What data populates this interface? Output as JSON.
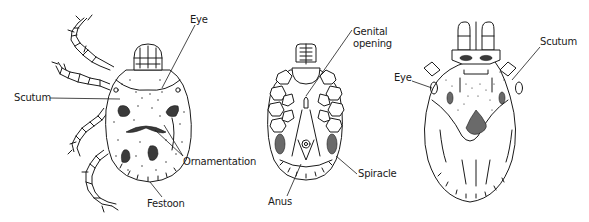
{
  "figures": [
    {
      "id": "dorsal-female",
      "labels": {
        "eye": "Eye",
        "scutum": "Scutum",
        "ornamentation": "Ornamentation",
        "festoon": "Festoon"
      }
    },
    {
      "id": "ventral",
      "labels": {
        "genital_line1": "Genital",
        "genital_line2": "opening",
        "spiracle": "Spiracle",
        "anus": "Anus"
      }
    },
    {
      "id": "dorsal-male",
      "labels": {
        "eye": "Eye",
        "scutum": "Scutum"
      }
    }
  ],
  "colors": {
    "ink": "#1a1a1a",
    "background": "#ffffff",
    "ornament_fill": "#3a3a3a",
    "shade_fill": "#6a6a6a"
  }
}
